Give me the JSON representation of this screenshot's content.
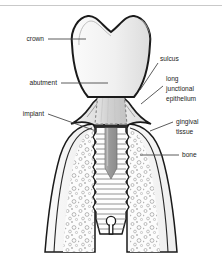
{
  "figure": {
    "kind": "anatomical-diagram",
    "background_color": "#ffffff",
    "top_rule_color": "#c9c9c9"
  },
  "palette": {
    "outline": "#1a1a1a",
    "label_text": "#1c1c1c",
    "leader_line": "#4a4a4a",
    "crown_fill": "#f2f2f2",
    "crown_fill_shadow": "#e2e2e2",
    "abutment_fill": "#d8d8d8",
    "abutment_dash": "#7a7a7a",
    "gingiva_fill": "#ededed",
    "gingiva_fill_shadow": "#dcdcdc",
    "bone_cortical_fill": "#f4f4f4",
    "bone_trabecular_fill": "#fbfbfb",
    "bone_speckle": "#9a9a9a",
    "implant_fill": "#fdfdfd",
    "implant_thread_line": "#6f6f6f",
    "screw_channel_fill": "#9b9b9b",
    "screw_channel_dark": "#8a8a8a",
    "platform_bar": "#2b2b2b"
  },
  "labels": {
    "left": [
      {
        "id": "crown",
        "text": "crown",
        "text_x": 44,
        "text_y": 41,
        "anchor": "end",
        "leader": [
          [
            48,
            39
          ],
          [
            86,
            39
          ]
        ]
      },
      {
        "id": "abutment",
        "text": "abutment",
        "text_y": 85,
        "text_x": 57,
        "anchor": "end",
        "leader": [
          [
            61,
            83
          ],
          [
            108,
            83
          ]
        ]
      },
      {
        "id": "implant",
        "text": "implant",
        "text_x": 44,
        "text_y": 116,
        "anchor": "end",
        "leader": [
          [
            48,
            114
          ],
          [
            96,
            131
          ]
        ]
      }
    ],
    "right": [
      {
        "id": "sulcus",
        "lines": [
          "sulcus"
        ],
        "text_x": 160,
        "text_y": 61,
        "anchor": "start",
        "leader": [
          [
            158,
            63
          ],
          [
            140,
            90
          ]
        ]
      },
      {
        "id": "long-junctional-epithelium",
        "lines": [
          "long",
          "junctional",
          "epithelium"
        ],
        "text_x": 166,
        "text_y": 81,
        "line_height": 10,
        "anchor": "start",
        "leader": [
          [
            163,
            86
          ],
          [
            141,
            104
          ]
        ]
      },
      {
        "id": "gingival-tissue",
        "lines": [
          "gingival",
          "tissue"
        ],
        "text_x": 176,
        "text_y": 124,
        "line_height": 10,
        "anchor": "start",
        "leader": [
          [
            173,
            122
          ],
          [
            150,
            131
          ]
        ]
      },
      {
        "id": "bone",
        "lines": [
          "bone"
        ],
        "text_x": 182,
        "text_y": 157,
        "anchor": "start",
        "leader": [
          [
            179,
            155
          ],
          [
            140,
            155
          ]
        ]
      }
    ]
  },
  "structures": {
    "crown": {
      "name": "crown",
      "description": "molar crown with two cusps and central fissure"
    },
    "abutment": {
      "name": "abutment",
      "description": "dashed trapezoidal post seated on implant platform"
    },
    "implant": {
      "name": "implant",
      "description": "threaded endosseous screw implant with internal screw channel"
    },
    "gingival_tissue": {
      "name": "gingival tissue",
      "description": "soft tissue collar around abutment"
    },
    "sulcus": {
      "name": "sulcus",
      "description": "gap between gingiva and abutment"
    },
    "long_junctional_epithelium": {
      "name": "long junctional epithelium",
      "description": "epithelial attachment along abutment"
    },
    "bone": {
      "name": "bone",
      "description": "cortical plate with trabecular cancellous bone"
    }
  }
}
